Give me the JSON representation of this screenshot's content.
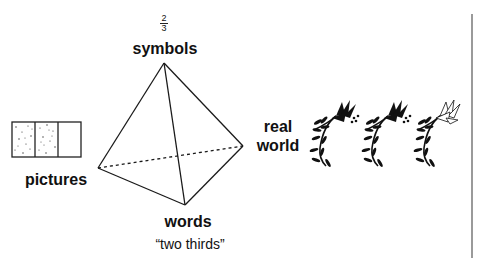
{
  "diagram": {
    "fraction": {
      "numerator": "2",
      "denominator": "3"
    },
    "vertices": {
      "top": "symbols",
      "left": "pictures",
      "bottom": "words",
      "bottom_sub": "“two thirds”",
      "right_line1": "real",
      "right_line2": "world"
    },
    "pictures_icon": {
      "segments": 3,
      "shaded": 2
    },
    "real_world_icon": {
      "sprigs": 3,
      "filled_sprigs": 2
    },
    "colors": {
      "ink": "#111111",
      "divider": "#9a9a9a"
    }
  }
}
